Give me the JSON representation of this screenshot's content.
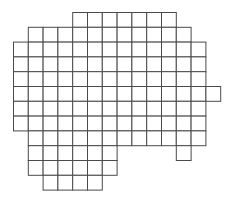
{
  "diagram": {
    "type": "grid-shape",
    "colors": {
      "cell_fill": "#ffffff",
      "cell_stroke": "#4a4a4a",
      "background": "#ffffff"
    },
    "rows": [
      {
        "row": 0,
        "cols": [
          4,
          5,
          6,
          7,
          8,
          9,
          10
        ]
      },
      {
        "row": 1,
        "cols": [
          1,
          2,
          3,
          4,
          5,
          6,
          7,
          8,
          9,
          10,
          11
        ]
      },
      {
        "row": 2,
        "cols": [
          0,
          1,
          2,
          3,
          4,
          5,
          6,
          7,
          8,
          9,
          10,
          11,
          12
        ]
      },
      {
        "row": 3,
        "cols": [
          0,
          1,
          2,
          3,
          4,
          5,
          6,
          7,
          8,
          9,
          10,
          11,
          12
        ]
      },
      {
        "row": 4,
        "cols": [
          0,
          1,
          2,
          3,
          4,
          5,
          6,
          7,
          8,
          9,
          10,
          11,
          12
        ]
      },
      {
        "row": 5,
        "cols": [
          0,
          1,
          2,
          3,
          4,
          5,
          6,
          7,
          8,
          9,
          10,
          11,
          12,
          13
        ]
      },
      {
        "row": 6,
        "cols": [
          0,
          1,
          2,
          3,
          4,
          5,
          6,
          7,
          8,
          9,
          10,
          11,
          12
        ]
      },
      {
        "row": 7,
        "cols": [
          0,
          1,
          2,
          3,
          4,
          5,
          6,
          7,
          8,
          9,
          10,
          11,
          12
        ]
      },
      {
        "row": 8,
        "cols": [
          1,
          2,
          3,
          4,
          5,
          6,
          7,
          8,
          9,
          10,
          11,
          12
        ]
      },
      {
        "row": 9,
        "cols": [
          1,
          2,
          3,
          4,
          5,
          6,
          11
        ]
      },
      {
        "row": 10,
        "cols": [
          1,
          2,
          3,
          4,
          5,
          6
        ]
      },
      {
        "row": 11,
        "cols": [
          2,
          3,
          4,
          5
        ]
      }
    ]
  }
}
